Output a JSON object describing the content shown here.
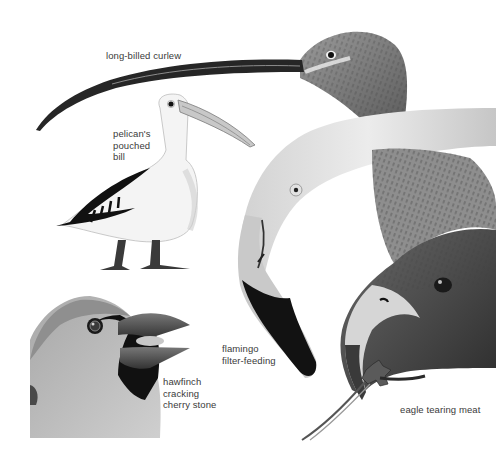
{
  "illustration": {
    "subject": "bird bill adaptations",
    "background": "#ffffff",
    "birds": [
      {
        "id": "curlew",
        "label": "long-billed curlew",
        "position": {
          "x": 106,
          "y": 50
        }
      },
      {
        "id": "pelican",
        "label": "pelican's\npouched\nbill",
        "position": {
          "x": 113,
          "y": 128
        }
      },
      {
        "id": "flamingo",
        "label": "flamingo\nfilter-feeding",
        "position": {
          "x": 222,
          "y": 343
        }
      },
      {
        "id": "hawfinch",
        "label": "hawfinch\ncracking\ncherry stone",
        "position": {
          "x": 163,
          "y": 376
        }
      },
      {
        "id": "eagle",
        "label": "eagle tearing meat",
        "position": {
          "x": 400,
          "y": 404
        }
      }
    ]
  },
  "colors": {
    "ink_dark": "#1a1a1a",
    "mid_gray": "#8a8a8a",
    "light_gray": "#d8d8d8",
    "label_text": "#3a3a3a"
  }
}
